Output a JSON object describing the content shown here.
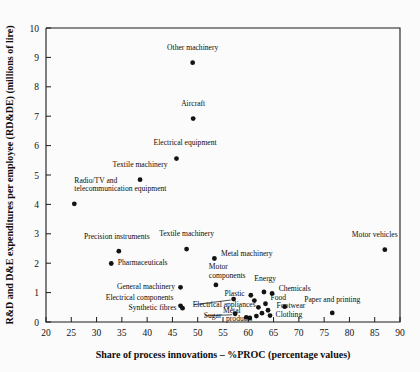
{
  "chart_data": {
    "type": "scatter",
    "title": "",
    "xlabel": "Share of process innovations – %PROC (percentage values)",
    "ylabel": "R&D and D&E expenditures per employee (RD&DE) (millions of lire)",
    "xlim": [
      20,
      90
    ],
    "ylim": [
      0,
      10
    ],
    "xticks": [
      20,
      25,
      30,
      35,
      40,
      45,
      50,
      55,
      60,
      65,
      70,
      75,
      80,
      85,
      90
    ],
    "yticks": [
      0,
      1,
      2,
      3,
      4,
      5,
      6,
      7,
      8,
      9,
      10
    ],
    "grid": false,
    "legend": "none",
    "marker": "filled-circle",
    "marker_color": "#131313",
    "points": [
      {
        "label": "Other machinery",
        "x": 49.0,
        "y": 8.82,
        "lx": 49.0,
        "ly": 9.25,
        "anchor": "middle",
        "leader": false
      },
      {
        "label": "Aircraft",
        "x": 49.1,
        "y": 6.92,
        "lx": 49.1,
        "ly": 7.35,
        "anchor": "middle",
        "leader": false
      },
      {
        "label": "Electrical equipment",
        "x": 45.8,
        "y": 5.56,
        "lx": 47.5,
        "ly": 6.02,
        "anchor": "middle",
        "leader": false
      },
      {
        "label": "Textile machinery",
        "x": 38.6,
        "y": 4.84,
        "lx": 38.6,
        "ly": 5.27,
        "anchor": "middle",
        "leader": false
      },
      {
        "label": "Radio/TV and",
        "x": 25.6,
        "y": 4.02,
        "lx": 25.6,
        "ly": 4.74,
        "anchor": "start",
        "leader": false
      },
      {
        "label": "telecommunication equipment",
        "x": null,
        "y": null,
        "lx": 25.6,
        "ly": 4.44,
        "anchor": "start",
        "leader": false
      },
      {
        "label": "Motor vehicles",
        "x": 87.0,
        "y": 2.46,
        "lx": 85.0,
        "ly": 2.9,
        "anchor": "middle",
        "leader": false
      },
      {
        "label": "Textile machinery",
        "x": 47.8,
        "y": 2.48,
        "lx": 47.8,
        "ly": 2.92,
        "anchor": "middle",
        "leader": false
      },
      {
        "label": "Metal machinery",
        "x": 53.3,
        "y": 2.16,
        "lx": 54.6,
        "ly": 2.23,
        "anchor": "start",
        "leader": false
      },
      {
        "label": "Precision instruments",
        "x": 34.4,
        "y": 2.41,
        "lx": 34.0,
        "ly": 2.84,
        "anchor": "middle",
        "leader": false
      },
      {
        "label": "Pharmaceuticals",
        "x": 32.9,
        "y": 1.99,
        "lx": 34.2,
        "ly": 1.93,
        "anchor": "start",
        "leader": false
      },
      {
        "label": "General machinery",
        "x": 46.6,
        "y": 1.18,
        "lx": 45.5,
        "ly": 1.12,
        "anchor": "end",
        "leader": false
      },
      {
        "label": "Motor",
        "x": 53.6,
        "y": 1.26,
        "lx": 52.2,
        "ly": 1.8,
        "anchor": "start",
        "leader": false
      },
      {
        "label": "components",
        "x": null,
        "y": null,
        "lx": 52.2,
        "ly": 1.5,
        "anchor": "start",
        "leader": false
      },
      {
        "label": "Energy",
        "x": 63.1,
        "y": 1.02,
        "lx": 61.2,
        "ly": 1.38,
        "anchor": "start",
        "leader": false
      },
      {
        "label": "Chemicals",
        "x": 64.7,
        "y": 0.97,
        "lx": 66.0,
        "ly": 1.06,
        "anchor": "start",
        "leader": false
      },
      {
        "label": "Plastic",
        "x": 60.5,
        "y": 0.91,
        "lx": 59.3,
        "ly": 0.9,
        "anchor": "end",
        "leader": false
      },
      {
        "label": "Food",
        "x": null,
        "y": null,
        "lx": 64.4,
        "ly": 0.76,
        "anchor": "start",
        "leader": false
      },
      {
        "label": "Electrical components",
        "x": 46.6,
        "y": 0.55,
        "lx": 45.2,
        "ly": 0.74,
        "anchor": "end",
        "leader": false
      },
      {
        "label": "Electrical appliances",
        "x": 57.1,
        "y": 0.78,
        "lx": 49.0,
        "ly": 0.52,
        "anchor": "start",
        "leader": true
      },
      {
        "label": "Footwear",
        "x": 67.2,
        "y": 0.52,
        "lx": 65.6,
        "ly": 0.47,
        "anchor": "start",
        "leader": false
      },
      {
        "label": "Synthetic fibres",
        "x": 47.0,
        "y": 0.47,
        "lx": 45.8,
        "ly": 0.4,
        "anchor": "end",
        "leader": false
      },
      {
        "label": "Clothing",
        "x": 64.3,
        "y": 0.22,
        "lx": 65.4,
        "ly": 0.18,
        "anchor": "start",
        "leader": false
      },
      {
        "label": "Sugar",
        "x": 57.4,
        "y": 0.28,
        "lx": 51.2,
        "ly": 0.14,
        "anchor": "start",
        "leader": true
      },
      {
        "label": "Metal",
        "x": 60.3,
        "y": 0.14,
        "lx": 55.0,
        "ly": 0.3,
        "anchor": "start",
        "leader": false
      },
      {
        "label": "products",
        "x": null,
        "y": null,
        "lx": 55.6,
        "ly": 0.02,
        "anchor": "start",
        "leader": false
      },
      {
        "label": "Paper and printing",
        "x": 76.6,
        "y": 0.31,
        "lx": 76.6,
        "ly": 0.68,
        "anchor": "middle",
        "leader": false
      },
      {
        "label": "",
        "x": 61.2,
        "y": 0.73,
        "lx": null,
        "ly": null,
        "anchor": "middle",
        "leader": false
      },
      {
        "label": "",
        "x": 62.0,
        "y": 0.5,
        "lx": null,
        "ly": null,
        "anchor": "middle",
        "leader": false
      },
      {
        "label": "",
        "x": 62.7,
        "y": 0.3,
        "lx": null,
        "ly": null,
        "anchor": "middle",
        "leader": false
      },
      {
        "label": "",
        "x": 61.6,
        "y": 0.2,
        "lx": null,
        "ly": null,
        "anchor": "middle",
        "leader": false
      },
      {
        "label": "",
        "x": 63.4,
        "y": 0.62,
        "lx": null,
        "ly": null,
        "anchor": "middle",
        "leader": false
      },
      {
        "label": "",
        "x": 63.9,
        "y": 0.4,
        "lx": null,
        "ly": null,
        "anchor": "middle",
        "leader": false
      },
      {
        "label": "",
        "x": 59.6,
        "y": 0.16,
        "lx": null,
        "ly": null,
        "anchor": "middle",
        "leader": false
      }
    ]
  },
  "colors": {
    "background": "#fbfbfb",
    "axis": "#1a1a1a",
    "marker": "#131313",
    "text": "#0d0d0d"
  }
}
